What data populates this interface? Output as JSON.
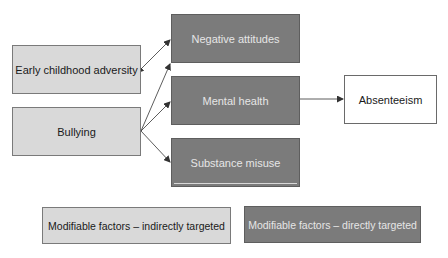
{
  "diagram": {
    "nodes": {
      "early_childhood_adversity": {
        "label": "Early childhood adversity",
        "category": "indirect"
      },
      "bullying": {
        "label": "Bullying",
        "category": "indirect"
      },
      "negative_attitudes": {
        "label": "Negative attitudes",
        "category": "direct"
      },
      "mental_health": {
        "label": "Mental health",
        "category": "direct"
      },
      "substance_misuse": {
        "label": "Substance misuse",
        "category": "direct"
      },
      "absenteeism": {
        "label": "Absenteeism",
        "category": "outcome"
      }
    },
    "edges": [
      {
        "from": "early_childhood_adversity",
        "to": "negative_attitudes",
        "bidirectional": true
      },
      {
        "from": "bullying",
        "to": "negative_attitudes",
        "bidirectional": false
      },
      {
        "from": "bullying",
        "to": "mental_health",
        "bidirectional": false
      },
      {
        "from": "bullying",
        "to": "substance_misuse",
        "bidirectional": false
      },
      {
        "from": "mental_health",
        "to": "absenteeism",
        "bidirectional": false
      }
    ],
    "legend": {
      "indirect": "Modifiable factors – indirectly targeted",
      "direct": "Modifiable factors – directly targeted"
    },
    "colors": {
      "indirect_fill": "#d9d9d9",
      "direct_fill": "#7b7b7b",
      "outcome_fill": "#ffffff",
      "arrow": "#333333"
    }
  }
}
